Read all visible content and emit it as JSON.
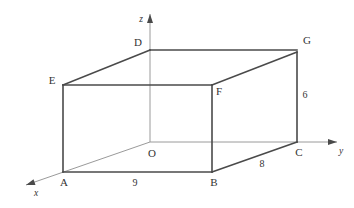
{
  "figure": {
    "background_color": "#ffffff",
    "edge_color": "#4a4a4a",
    "axis_color": "#9a9a9a",
    "text_color": "#333333"
  },
  "axes": [
    {
      "name": "x",
      "label": "x",
      "label_x": 36,
      "label_y": 194,
      "tip_x": 26,
      "tip_y": 185,
      "from_x": 150,
      "from_y": 142
    },
    {
      "name": "y",
      "label": "y",
      "label_x": 341,
      "label_y": 152,
      "tip_x": 337,
      "tip_y": 142,
      "from_x": 150,
      "from_y": 142
    },
    {
      "name": "z",
      "label": "z",
      "label_x": 141,
      "label_y": 20,
      "tip_x": 150,
      "tip_y": 14,
      "from_x": 150,
      "from_y": 142
    }
  ],
  "vertices": [
    {
      "name": "O",
      "label": "O",
      "x": 150,
      "y": 142,
      "label_x": 152,
      "label_y": 154
    },
    {
      "name": "A",
      "label": "A",
      "x": 63,
      "y": 172,
      "label_x": 64,
      "label_y": 183
    },
    {
      "name": "B",
      "label": "B",
      "x": 212,
      "y": 172,
      "label_x": 214,
      "label_y": 183
    },
    {
      "name": "C",
      "label": "C",
      "x": 297,
      "y": 142,
      "label_x": 299,
      "label_y": 153
    },
    {
      "name": "D",
      "label": "D",
      "x": 150,
      "y": 50,
      "label_x": 138,
      "label_y": 43
    },
    {
      "name": "E",
      "label": "E",
      "x": 63,
      "y": 85,
      "label_x": 52,
      "label_y": 81
    },
    {
      "name": "F",
      "label": "F",
      "x": 212,
      "y": 85,
      "label_x": 219,
      "label_y": 92
    },
    {
      "name": "G",
      "label": "G",
      "x": 297,
      "y": 52,
      "label_x": 307,
      "label_y": 41
    }
  ],
  "edges": [
    {
      "name": "edge-A-B",
      "x1": 63,
      "y1": 172,
      "x2": 212,
      "y2": 172
    },
    {
      "name": "edge-B-C",
      "x1": 212,
      "y1": 172,
      "x2": 297,
      "y2": 142
    },
    {
      "name": "edge-A-E",
      "x1": 63,
      "y1": 172,
      "x2": 63,
      "y2": 85
    },
    {
      "name": "edge-B-F",
      "x1": 212,
      "y1": 172,
      "x2": 212,
      "y2": 85
    },
    {
      "name": "edge-C-G",
      "x1": 297,
      "y1": 142,
      "x2": 297,
      "y2": 52
    },
    {
      "name": "edge-E-F",
      "x1": 63,
      "y1": 85,
      "x2": 212,
      "y2": 85
    },
    {
      "name": "edge-F-G",
      "x1": 212,
      "y1": 85,
      "x2": 297,
      "y2": 52
    },
    {
      "name": "edge-E-D",
      "x1": 63,
      "y1": 85,
      "x2": 150,
      "y2": 50
    },
    {
      "name": "edge-D-G",
      "x1": 150,
      "y1": 50,
      "x2": 297,
      "y2": 50
    }
  ],
  "dimensions": [
    {
      "name": "length-AB",
      "value": "9",
      "x": 135,
      "y": 184,
      "edge": "A-B"
    },
    {
      "name": "length-BC",
      "value": "8",
      "x": 262,
      "y": 165,
      "edge": "B-C"
    },
    {
      "name": "length-CG",
      "value": "6",
      "x": 305,
      "y": 96,
      "edge": "C-G"
    }
  ]
}
